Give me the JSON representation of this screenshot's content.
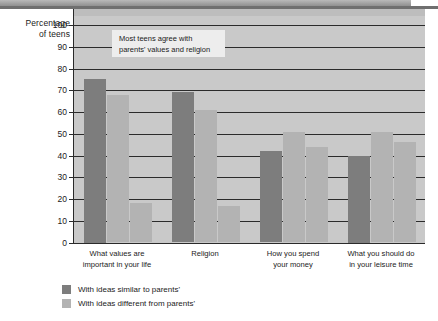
{
  "chart_data": {
    "type": "bar",
    "title": "",
    "subtitle": "",
    "xlabel": "",
    "ylabel": "Percentage of teens",
    "ylabel_line1": "Percentage",
    "ylabel_line2": "of teens",
    "ylim": [
      0,
      100
    ],
    "ytick_labels": [
      "100",
      "90",
      "80",
      "70",
      "60",
      "50",
      "40",
      "30",
      "20",
      "10",
      "0"
    ],
    "ytick_values": [
      100,
      90,
      80,
      70,
      60,
      50,
      40,
      30,
      20,
      10,
      0
    ],
    "grid": true,
    "grid_axis": "y",
    "legend_position": "bottom-left",
    "categories": [
      "What values are important in your life",
      "Religion",
      "How you spend your money",
      "What you should do in your leisure time"
    ],
    "category_lines": [
      [
        "What values are",
        "important in your life"
      ],
      [
        "Religion",
        ""
      ],
      [
        "How you spend",
        "your money"
      ],
      [
        "What you should do",
        "in your leisure time"
      ]
    ],
    "series": [
      {
        "name": "With ideas similar to parents'",
        "color": "#7d7d7d",
        "values": [
          75,
          69,
          42,
          40
        ]
      },
      {
        "name": "With ideas different from parents'",
        "color": "#b3b3b3",
        "values": [
          68,
          61,
          51,
          51
        ]
      },
      {
        "name": "With ideas different from parents'",
        "color": "#b3b3b3",
        "values": [
          18,
          17,
          44,
          46
        ]
      }
    ],
    "bar_values_flat": [
      75,
      68,
      18,
      69,
      61,
      17,
      42,
      51,
      44,
      40,
      51,
      46
    ],
    "annotations": [
      {
        "text": "Most teens agree with parents' values and religion",
        "line1": "Most teens agree with",
        "line2": "parents' values and religion"
      }
    ]
  },
  "legend": {
    "items": [
      {
        "label": "With ideas similar to parents'",
        "color": "#7d7d7d"
      },
      {
        "label": "With ideas different from parents'",
        "color": "#b3b3b3"
      }
    ]
  },
  "colors": {
    "plot_background": "#c9c9c9",
    "bar_dark": "#7d7d7d",
    "bar_light": "#b3b3b3",
    "axis": "#2a2a2a",
    "text": "#1b1b1b",
    "callout_background": "#ededed"
  }
}
